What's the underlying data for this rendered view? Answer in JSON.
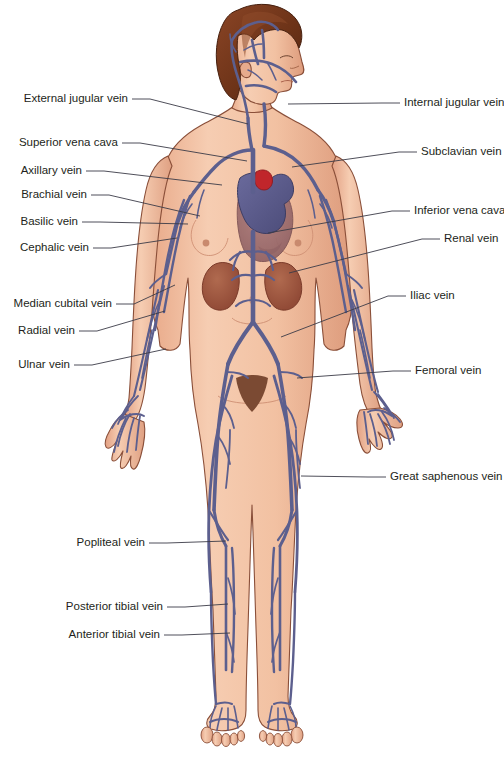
{
  "diagram": {
    "background_color": "#ffffff",
    "palette": {
      "skin": "#f2c3a5",
      "skin_shadow": "#e0a183",
      "skin_outline": "#7a4a36",
      "vein": "#5c5f8e",
      "vein_dark": "#3f4268",
      "hair": "#7b3b22",
      "hair_dark": "#5a2a16",
      "heart": "#5d5d8f",
      "heart_muscle": "#9b6d70",
      "aorta_red": "#c0262b",
      "kidney": "#9e5440",
      "label_text": "#231f20",
      "leader_line": "#3b3b47"
    },
    "labels_left": [
      {
        "id": "external-jugular-vein",
        "text": "External jugular vein",
        "x": 128,
        "y": 99,
        "tip_x": 248,
        "tip_y": 124
      },
      {
        "id": "superior-vena-cava",
        "text": "Superior vena cava",
        "x": 118,
        "y": 143,
        "tip_x": 247,
        "tip_y": 161
      },
      {
        "id": "axillary-vein",
        "text": "Axillary vein",
        "x": 82,
        "y": 171,
        "tip_x": 222,
        "tip_y": 185
      },
      {
        "id": "brachial-vein",
        "text": "Brachial vein",
        "x": 87,
        "y": 195,
        "tip_x": 200,
        "tip_y": 216
      },
      {
        "id": "basilic-vein",
        "text": "Basilic vein",
        "x": 78,
        "y": 222,
        "tip_x": 188,
        "tip_y": 224
      },
      {
        "id": "cephalic-vein",
        "text": "Cephalic vein",
        "x": 89,
        "y": 248,
        "tip_x": 177,
        "tip_y": 238
      },
      {
        "id": "median-cubital-vein",
        "text": "Median cubital vein",
        "x": 112,
        "y": 304,
        "tip_x": 175,
        "tip_y": 285
      },
      {
        "id": "radial-vein",
        "text": "Radial vein",
        "x": 75,
        "y": 331,
        "tip_x": 165,
        "tip_y": 311
      },
      {
        "id": "ulnar-vein",
        "text": "Ulnar vein",
        "x": 70,
        "y": 365,
        "tip_x": 166,
        "tip_y": 349
      },
      {
        "id": "popliteal-vein",
        "text": "Popliteal vein",
        "x": 145,
        "y": 543,
        "tip_x": 226,
        "tip_y": 541
      },
      {
        "id": "posterior-tibial-vein",
        "text": "Posterior tibial vein",
        "x": 163,
        "y": 607,
        "tip_x": 228,
        "tip_y": 604
      },
      {
        "id": "anterior-tibial-vein",
        "text": "Anterior tibial vein",
        "x": 160,
        "y": 635,
        "tip_x": 230,
        "tip_y": 633
      }
    ],
    "labels_right": [
      {
        "id": "internal-jugular-vein",
        "text": "Internal jugular vein",
        "x": 404,
        "y": 103,
        "tip_x": 288,
        "tip_y": 104
      },
      {
        "id": "subclavian-vein",
        "text": "Subclavian vein",
        "x": 421,
        "y": 152,
        "tip_x": 292,
        "tip_y": 167
      },
      {
        "id": "inferior-vena-cava",
        "text": "Inferior vena cava",
        "x": 414,
        "y": 211,
        "tip_x": 268,
        "tip_y": 233
      },
      {
        "id": "renal-vein",
        "text": "Renal vein",
        "x": 444,
        "y": 239,
        "tip_x": 289,
        "tip_y": 273
      },
      {
        "id": "iliac-vein",
        "text": "Iliac vein",
        "x": 410,
        "y": 296,
        "tip_x": 281,
        "tip_y": 337
      },
      {
        "id": "femoral-vein",
        "text": "Femoral vein",
        "x": 415,
        "y": 371,
        "tip_x": 297,
        "tip_y": 378
      },
      {
        "id": "great-saphenous-vein",
        "text": "Great saphenous vein",
        "x": 390,
        "y": 477,
        "tip_x": 301,
        "tip_y": 476
      }
    ],
    "structures": [
      {
        "id": "head",
        "name": "head-profile-facing-right"
      },
      {
        "id": "hair",
        "name": "brown-bob-hairstyle"
      },
      {
        "id": "heart",
        "name": "heart-with-red-aorta"
      },
      {
        "id": "kidneys",
        "name": "pair-of-kidneys"
      },
      {
        "id": "torso",
        "name": "female-torso-anterior"
      },
      {
        "id": "arms",
        "name": "both-arms-with-hands"
      },
      {
        "id": "legs",
        "name": "both-legs-with-feet"
      }
    ]
  }
}
